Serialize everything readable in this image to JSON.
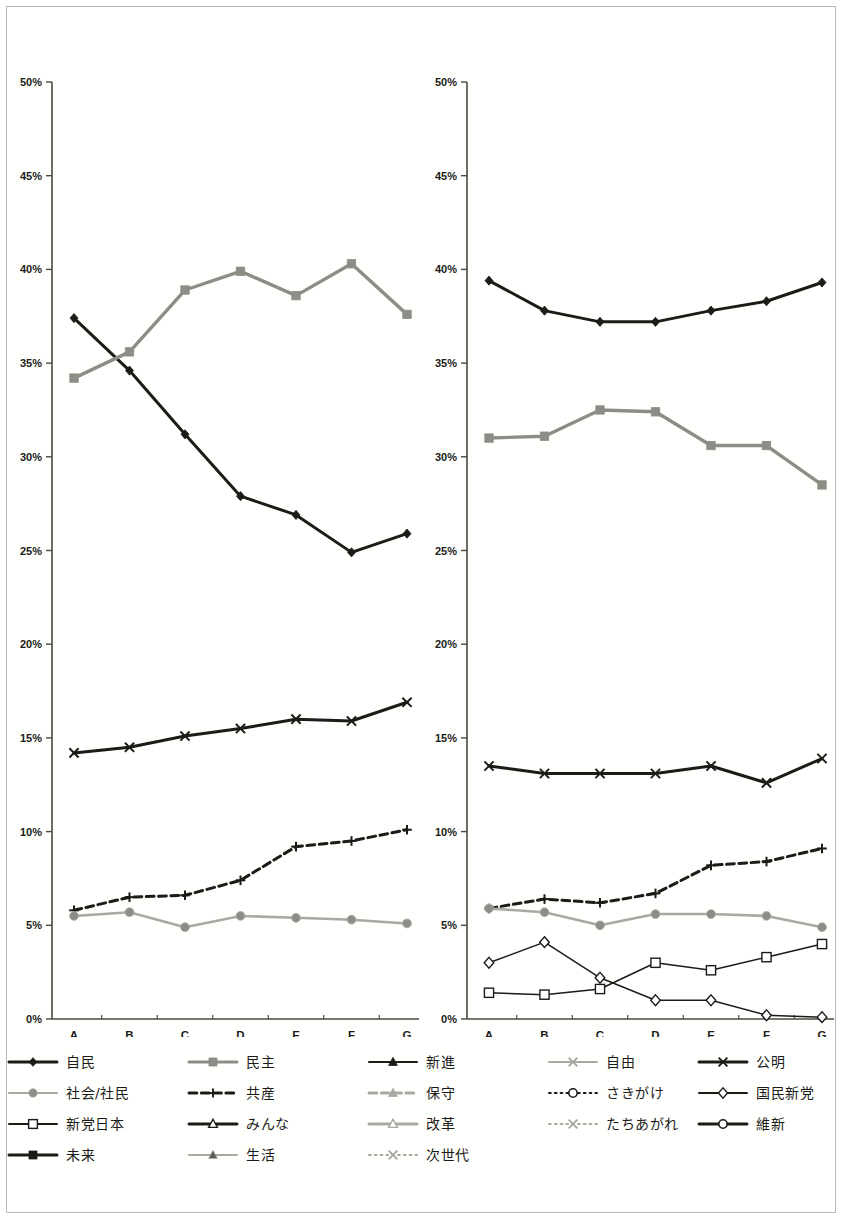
{
  "axis": {
    "y_ticks": [
      "0%",
      "5%",
      "10%",
      "15%",
      "20%",
      "25%",
      "30%",
      "35%",
      "40%",
      "45%",
      "50%"
    ],
    "y_min": 0,
    "y_max": 50,
    "y_step": 5,
    "x_categories": [
      "A",
      "B",
      "C",
      "D",
      "E",
      "F",
      "G"
    ],
    "grid": false
  },
  "colors": {
    "black": "#1b1b18",
    "dark": "#2a2a25",
    "gray": "#8d8d85",
    "lightgray": "#a9a9a2",
    "axis": "#4a4a44",
    "white": "#ffffff"
  },
  "legend": {
    "position": "bottom",
    "items": [
      {
        "label": "自民",
        "color": "#1b1b18",
        "marker": "diamond",
        "fill": "#1b1b18",
        "dash": "solid",
        "width": 3
      },
      {
        "label": "民主",
        "color": "#8d8d85",
        "marker": "square",
        "fill": "#8d8d85",
        "dash": "solid",
        "width": 3
      },
      {
        "label": "新進",
        "color": "#1b1b18",
        "marker": "triangle",
        "fill": "#1b1b18",
        "dash": "solid",
        "width": 2
      },
      {
        "label": "自由",
        "color": "#a9a9a2",
        "marker": "x",
        "fill": "#a9a9a2",
        "dash": "solid",
        "width": 2
      },
      {
        "label": "公明",
        "color": "#1b1b18",
        "marker": "x",
        "fill": "#1b1b18",
        "dash": "solid",
        "width": 3
      },
      {
        "label": "社会/社民",
        "color": "#a9a9a2",
        "marker": "circle",
        "fill": "#8d8d85",
        "dash": "solid",
        "width": 2
      },
      {
        "label": "共産",
        "color": "#1b1b18",
        "marker": "plus",
        "fill": "#1b1b18",
        "dash": "dashed",
        "width": 3
      },
      {
        "label": "保守",
        "color": "#a9a9a2",
        "marker": "triangle",
        "fill": "#a9a9a2",
        "dash": "dashed",
        "width": 3
      },
      {
        "label": "さきがけ",
        "color": "#1b1b18",
        "marker": "circle-open",
        "fill": "#ffffff",
        "dash": "dotted",
        "width": 2
      },
      {
        "label": "国民新党",
        "color": "#1b1b18",
        "marker": "diamond-open",
        "fill": "#ffffff",
        "dash": "solid",
        "width": 2
      },
      {
        "label": "新党日本",
        "color": "#1b1b18",
        "marker": "square-open",
        "fill": "#ffffff",
        "dash": "solid",
        "width": 2
      },
      {
        "label": "みんな",
        "color": "#1b1b18",
        "marker": "triangle-open",
        "fill": "#ffffff",
        "dash": "solid",
        "width": 3
      },
      {
        "label": "改革",
        "color": "#a9a9a2",
        "marker": "triangle-open",
        "fill": "#ffffff",
        "dash": "solid",
        "width": 3
      },
      {
        "label": "たちあがれ",
        "color": "#a9a9a2",
        "marker": "x",
        "fill": "#a9a9a2",
        "dash": "dotted",
        "width": 2
      },
      {
        "label": "維新",
        "color": "#1b1b18",
        "marker": "circle-open",
        "fill": "#ffffff",
        "dash": "solid",
        "width": 3
      },
      {
        "label": "未来",
        "color": "#1b1b18",
        "marker": "square",
        "fill": "#1b1b18",
        "dash": "solid",
        "width": 3
      },
      {
        "label": "生活",
        "color": "#a9a9a2",
        "marker": "triangle",
        "fill": "#5d5d56",
        "dash": "solid",
        "width": 2
      },
      {
        "label": "次世代",
        "color": "#a9a9a2",
        "marker": "x",
        "fill": "#8d8d85",
        "dash": "dotted",
        "width": 2
      }
    ]
  },
  "chart_data": [
    {
      "id": "left-chart",
      "type": "line",
      "title": "",
      "xlabel": "",
      "ylabel": "",
      "x": [
        "A",
        "B",
        "C",
        "D",
        "E",
        "F",
        "G"
      ],
      "ylim": [
        0,
        50
      ],
      "ytick_labels": [
        "0%",
        "5%",
        "10%",
        "15%",
        "20%",
        "25%",
        "30%",
        "35%",
        "40%",
        "45%",
        "50%"
      ],
      "legend": "none",
      "series": [
        {
          "name": "自民",
          "marker": "diamond",
          "color": "#1b1b18",
          "fill": "#1b1b18",
          "dash": "solid",
          "width": 3,
          "values": [
            37.4,
            34.6,
            31.2,
            27.9,
            26.9,
            24.9,
            25.9
          ]
        },
        {
          "name": "民主",
          "marker": "square",
          "color": "#8d8d85",
          "fill": "#8d8d85",
          "dash": "solid",
          "width": 3.4,
          "values": [
            34.2,
            35.6,
            38.9,
            39.9,
            38.6,
            40.3,
            37.6
          ]
        },
        {
          "name": "公明",
          "marker": "x",
          "color": "#1b1b18",
          "fill": "#1b1b18",
          "dash": "solid",
          "width": 3,
          "values": [
            14.2,
            14.5,
            15.1,
            15.5,
            16.0,
            15.9,
            16.9
          ]
        },
        {
          "name": "共産",
          "marker": "plus",
          "color": "#1b1b18",
          "fill": "#1b1b18",
          "dash": "dashed",
          "width": 3,
          "values": [
            5.8,
            6.5,
            6.6,
            7.4,
            9.2,
            9.5,
            10.1
          ]
        },
        {
          "name": "社会/社民",
          "marker": "circle",
          "color": "#a9a9a2",
          "fill": "#8d8d85",
          "dash": "solid",
          "width": 2.6,
          "values": [
            5.5,
            5.7,
            4.9,
            5.5,
            5.4,
            5.3,
            5.1
          ]
        }
      ]
    },
    {
      "id": "right-chart",
      "type": "line",
      "title": "",
      "xlabel": "",
      "ylabel": "",
      "x": [
        "A",
        "B",
        "C",
        "D",
        "E",
        "F",
        "G"
      ],
      "ylim": [
        0,
        50
      ],
      "ytick_labels": [
        "0%",
        "5%",
        "10%",
        "15%",
        "20%",
        "25%",
        "30%",
        "35%",
        "40%",
        "45%",
        "50%"
      ],
      "legend": "none",
      "series": [
        {
          "name": "自民",
          "marker": "diamond",
          "color": "#1b1b18",
          "fill": "#1b1b18",
          "dash": "solid",
          "width": 3,
          "values": [
            39.4,
            37.8,
            37.2,
            37.2,
            37.8,
            38.3,
            39.3
          ]
        },
        {
          "name": "民主",
          "marker": "square",
          "color": "#8d8d85",
          "fill": "#8d8d85",
          "dash": "solid",
          "width": 3.4,
          "values": [
            31.0,
            31.1,
            32.5,
            32.4,
            30.6,
            30.6,
            28.5
          ]
        },
        {
          "name": "公明",
          "marker": "x",
          "color": "#1b1b18",
          "fill": "#1b1b18",
          "dash": "solid",
          "width": 3,
          "values": [
            13.5,
            13.1,
            13.1,
            13.1,
            13.5,
            12.6,
            13.9
          ]
        },
        {
          "name": "共産",
          "marker": "plus",
          "color": "#1b1b18",
          "fill": "#1b1b18",
          "dash": "dashed",
          "width": 3,
          "values": [
            5.9,
            6.4,
            6.2,
            6.7,
            8.2,
            8.4,
            9.1
          ]
        },
        {
          "name": "社会/社民",
          "marker": "circle",
          "color": "#a9a9a2",
          "fill": "#8d8d85",
          "dash": "solid",
          "width": 2.6,
          "values": [
            5.9,
            5.7,
            5.0,
            5.6,
            5.6,
            5.5,
            4.9
          ]
        },
        {
          "name": "さきがけ",
          "marker": "diamond-open",
          "color": "#1b1b18",
          "fill": "#ffffff",
          "dash": "solid",
          "width": 1.5,
          "values": [
            3.0,
            4.1,
            2.2,
            1.0,
            1.0,
            0.2,
            0.1
          ]
        },
        {
          "name": "新党日本",
          "marker": "square-open",
          "color": "#1b1b18",
          "fill": "#ffffff",
          "dash": "solid",
          "width": 1.5,
          "values": [
            1.4,
            1.3,
            1.6,
            3.0,
            2.6,
            3.3,
            4.0
          ]
        }
      ]
    }
  ]
}
